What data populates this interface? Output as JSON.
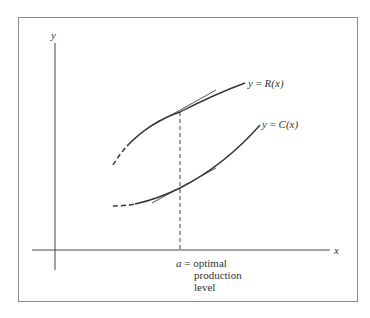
{
  "diagram": {
    "axes": {
      "x_label": "x",
      "y_label": "y"
    },
    "curves": [
      {
        "name": "revenue",
        "label_prefix": "y = ",
        "label_func": "R",
        "label_arg": "(x)"
      },
      {
        "name": "cost",
        "label_prefix": "y = ",
        "label_func": "C",
        "label_arg": "(x)"
      }
    ],
    "annotation": {
      "var": "a",
      "eq": " = ",
      "line1": "optimal",
      "line2": "production",
      "line3": "level"
    },
    "colors": {
      "stroke": "#333333",
      "frame": "#8a8a8a",
      "background": "#ffffff"
    }
  }
}
